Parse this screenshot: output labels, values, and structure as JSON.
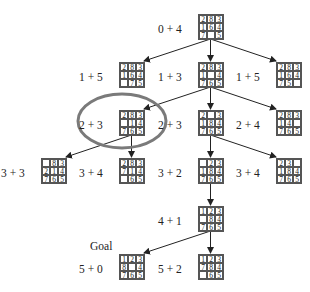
{
  "goal_label": "Goal",
  "highlight_color": "#7a7a7a",
  "nodes": [
    {
      "id": "n0",
      "label": "0 + 4",
      "board": [
        "2",
        "8",
        "3",
        "1",
        "6",
        "4",
        "7",
        "",
        "5"
      ],
      "x": 198,
      "y": 14
    },
    {
      "id": "n1",
      "label": "1 + 5",
      "board": [
        "2",
        "8",
        "3",
        "1",
        "6",
        "4",
        "",
        "7",
        "5"
      ],
      "x": 119,
      "y": 62
    },
    {
      "id": "n2",
      "label": "1 + 3",
      "board": [
        "2",
        "8",
        "3",
        "1",
        "",
        "4",
        "7",
        "6",
        "5"
      ],
      "x": 198,
      "y": 62
    },
    {
      "id": "n3",
      "label": "1 + 5",
      "board": [
        "2",
        "8",
        "3",
        "1",
        "6",
        "4",
        "7",
        "5",
        ""
      ],
      "x": 276,
      "y": 62
    },
    {
      "id": "n4",
      "label": "2 + 3",
      "board": [
        "2",
        "8",
        "3",
        "",
        "1",
        "4",
        "7",
        "6",
        "5"
      ],
      "x": 119,
      "y": 110
    },
    {
      "id": "n5",
      "label": "2 + 3",
      "board": [
        "2",
        "",
        "3",
        "1",
        "8",
        "4",
        "7",
        "6",
        "5"
      ],
      "x": 198,
      "y": 110
    },
    {
      "id": "n6",
      "label": "2 + 4",
      "board": [
        "2",
        "8",
        "3",
        "1",
        "4",
        "",
        "7",
        "6",
        "5"
      ],
      "x": 276,
      "y": 110
    },
    {
      "id": "n7",
      "label": "3 + 3",
      "board": [
        "",
        "8",
        "3",
        "2",
        "1",
        "4",
        "7",
        "6",
        "5"
      ],
      "x": 41,
      "y": 158
    },
    {
      "id": "n8",
      "label": "3 + 4",
      "board": [
        "2",
        "8",
        "3",
        "7",
        "1",
        "4",
        "",
        "6",
        "5"
      ],
      "x": 119,
      "y": 158
    },
    {
      "id": "n9",
      "label": "3 + 2",
      "board": [
        "",
        "2",
        "3",
        "1",
        "8",
        "4",
        "7",
        "6",
        "5"
      ],
      "x": 198,
      "y": 158
    },
    {
      "id": "n10",
      "label": "3 + 4",
      "board": [
        "2",
        "3",
        "",
        "1",
        "8",
        "4",
        "7",
        "6",
        "5"
      ],
      "x": 276,
      "y": 158
    },
    {
      "id": "n11",
      "label": "4 + 1",
      "board": [
        "1",
        "2",
        "3",
        "",
        "8",
        "4",
        "7",
        "6",
        "5"
      ],
      "x": 198,
      "y": 206
    },
    {
      "id": "n12",
      "label": "5 + 0",
      "board": [
        "1",
        "2",
        "3",
        "8",
        "",
        "4",
        "7",
        "6",
        "5"
      ],
      "x": 119,
      "y": 254
    },
    {
      "id": "n13",
      "label": "5 + 2",
      "board": [
        "1",
        "2",
        "3",
        "7",
        "8",
        "4",
        "",
        "6",
        "5"
      ],
      "x": 198,
      "y": 254
    }
  ],
  "edges": [
    [
      "n0",
      "n1"
    ],
    [
      "n0",
      "n2"
    ],
    [
      "n0",
      "n3"
    ],
    [
      "n2",
      "n4"
    ],
    [
      "n2",
      "n5"
    ],
    [
      "n2",
      "n6"
    ],
    [
      "n4",
      "n7"
    ],
    [
      "n4",
      "n8"
    ],
    [
      "n5",
      "n9"
    ],
    [
      "n5",
      "n10"
    ],
    [
      "n9",
      "n11"
    ],
    [
      "n11",
      "n12"
    ],
    [
      "n11",
      "n13"
    ]
  ],
  "highlight": {
    "node": "n4",
    "cx": 122,
    "cy": 121,
    "rx": 44,
    "ry": 27
  }
}
